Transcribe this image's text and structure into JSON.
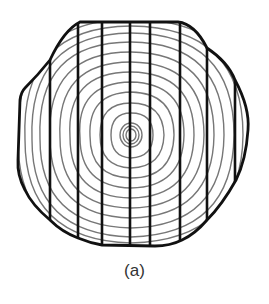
{
  "figure": {
    "caption": "(a)",
    "colors": {
      "outline": "#111111",
      "saw_cuts": "#111111",
      "growth_rings": "#777777",
      "background": "#ffffff"
    },
    "outline_points": [
      [
        80,
        22
      ],
      [
        178,
        22
      ],
      [
        207,
        48
      ],
      [
        235,
        80
      ],
      [
        248,
        130
      ],
      [
        236,
        180
      ],
      [
        207,
        220
      ],
      [
        182,
        240
      ],
      [
        155,
        246
      ],
      [
        102,
        245
      ],
      [
        78,
        238
      ],
      [
        50,
        220
      ],
      [
        25,
        190
      ],
      [
        18,
        160
      ],
      [
        20,
        100
      ],
      [
        25,
        88
      ],
      [
        50,
        60
      ],
      [
        80,
        22
      ]
    ],
    "saw_cut_x": [
      50,
      78,
      102,
      130,
      150,
      180,
      207,
      235
    ],
    "pith_center": [
      131,
      135
    ],
    "ring_radii": [
      5,
      8,
      11,
      20,
      30,
      40,
      50,
      60,
      70,
      80,
      90,
      100,
      110,
      120
    ]
  }
}
